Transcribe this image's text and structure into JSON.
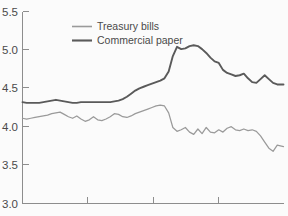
{
  "chart_data": {
    "type": "line",
    "title": "",
    "subtitle": "",
    "xlabel": "",
    "ylabel": "",
    "ylim": [
      3.0,
      5.5
    ],
    "xlim": [
      0,
      100
    ],
    "grid": false,
    "legend_position": "top-center",
    "y_ticks": [
      "3.0",
      "3.5",
      "4.0",
      "4.5",
      "5.0",
      "5.5"
    ],
    "y_tick_values": [
      3.0,
      3.5,
      4.0,
      4.5,
      5.0,
      5.5
    ],
    "x_ticks": [
      "",
      "",
      ""
    ],
    "x_tick_values": [
      25,
      50,
      75
    ],
    "colors": {
      "treasury_bills": "#9a9a9a",
      "commercial_paper": "#5a5a5a",
      "axis": "#8d8d8d",
      "background": "#fbfbfb",
      "text": "#4a4a4a"
    },
    "series": [
      {
        "name": "Treasury bills",
        "color": "#9a9a9a",
        "x": [
          0,
          1.6,
          3.2,
          4.8,
          6.4,
          8.0,
          9.6,
          11.2,
          12.8,
          14.4,
          16.0,
          17.6,
          19.2,
          20.8,
          22.4,
          24.0,
          25.6,
          27.2,
          28.8,
          30.4,
          32.0,
          33.6,
          35.2,
          36.8,
          38.4,
          40.0,
          41.6,
          43.2,
          44.8,
          46.4,
          48.0,
          49.6,
          51.2,
          52.8,
          54.4,
          56.0,
          57.6,
          59.2,
          60.8,
          62.4,
          64.0,
          65.6,
          67.2,
          68.8,
          70.4,
          72.0,
          73.6,
          75.2,
          76.8,
          78.4,
          80.0,
          81.6,
          83.2,
          84.8,
          86.4,
          88.0,
          89.6,
          91.2,
          92.8,
          94.4,
          96.0,
          97.6,
          100.0
        ],
        "y": [
          4.11,
          4.1,
          4.11,
          4.12,
          4.13,
          4.14,
          4.15,
          4.17,
          4.18,
          4.19,
          4.16,
          4.13,
          4.11,
          4.14,
          4.1,
          4.07,
          4.09,
          4.13,
          4.09,
          4.08,
          4.1,
          4.13,
          4.17,
          4.16,
          4.13,
          4.12,
          4.14,
          4.17,
          4.19,
          4.21,
          4.23,
          4.25,
          4.27,
          4.28,
          4.27,
          4.18,
          3.99,
          3.94,
          3.96,
          3.99,
          3.93,
          3.9,
          3.97,
          3.91,
          3.99,
          3.93,
          3.92,
          3.96,
          3.93,
          3.98,
          4.0,
          3.96,
          3.95,
          3.97,
          3.95,
          3.96,
          3.94,
          3.88,
          3.8,
          3.72,
          3.68,
          3.76,
          3.74
        ],
        "start_value": 4.11,
        "end_value": 3.74,
        "min_value": 3.68,
        "max_value": 4.28
      },
      {
        "name": "Commercial paper",
        "color": "#5a5a5a",
        "x": [
          0,
          1.6,
          3.2,
          4.8,
          6.4,
          8.0,
          9.6,
          11.2,
          12.8,
          14.4,
          16.0,
          17.6,
          19.2,
          20.8,
          22.4,
          24.0,
          25.6,
          27.2,
          28.8,
          30.4,
          32.0,
          33.6,
          35.2,
          36.8,
          38.4,
          40.0,
          41.6,
          43.2,
          44.8,
          46.4,
          48.0,
          49.6,
          51.2,
          52.8,
          54.4,
          56.0,
          57.6,
          59.2,
          60.8,
          62.4,
          64.0,
          65.6,
          67.2,
          68.8,
          70.4,
          72.0,
          73.6,
          75.2,
          76.8,
          78.4,
          80.0,
          81.6,
          83.2,
          84.8,
          86.4,
          88.0,
          89.6,
          91.2,
          92.8,
          94.4,
          96.0,
          97.6,
          100.0
        ],
        "y": [
          4.32,
          4.31,
          4.31,
          4.31,
          4.31,
          4.32,
          4.33,
          4.34,
          4.35,
          4.34,
          4.33,
          4.32,
          4.31,
          4.31,
          4.32,
          4.32,
          4.32,
          4.32,
          4.32,
          4.32,
          4.32,
          4.32,
          4.33,
          4.34,
          4.36,
          4.39,
          4.43,
          4.47,
          4.5,
          4.52,
          4.54,
          4.56,
          4.58,
          4.6,
          4.63,
          4.72,
          4.92,
          5.04,
          5.01,
          5.02,
          5.05,
          5.06,
          5.05,
          5.01,
          4.96,
          4.9,
          4.85,
          4.83,
          4.74,
          4.7,
          4.68,
          4.66,
          4.67,
          4.69,
          4.63,
          4.58,
          4.57,
          4.62,
          4.67,
          4.62,
          4.57,
          4.55,
          4.55
        ],
        "start_value": 4.32,
        "end_value": 4.55,
        "min_value": 4.31,
        "max_value": 5.06
      }
    ]
  },
  "legend": {
    "entries": [
      {
        "label": "Treasury bills",
        "color": "#9a9a9a",
        "swatch_name": "legend-swatch-treasury-bills"
      },
      {
        "label": "Commercial paper",
        "color": "#5a5a5a",
        "swatch_name": "legend-swatch-commercial-paper"
      }
    ]
  },
  "axes": {
    "y_labels": [
      "5.5",
      "5.0",
      "4.5",
      "4.0",
      "3.5",
      "3.0"
    ]
  }
}
